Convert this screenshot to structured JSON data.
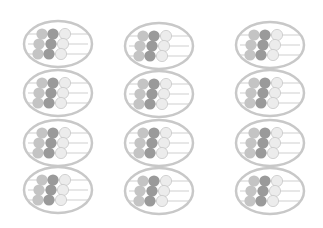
{
  "canvas": {
    "width": 323,
    "height": 228,
    "background": "#ffffff"
  },
  "colors": {
    "ring": "#c8c8c8",
    "rod": "#cfcfcf",
    "bead_light": "#c4c4c4",
    "bead_dark": "#9a9a9a",
    "bead_white": "#ececec",
    "bead_white_stroke": "#c8c8c8"
  },
  "grid": {
    "columns": 3,
    "rows": 4,
    "icon": "abacus-icon",
    "items": [
      {
        "x": 22,
        "y": 19
      },
      {
        "x": 123,
        "y": 21
      },
      {
        "x": 234,
        "y": 20
      },
      {
        "x": 22,
        "y": 68
      },
      {
        "x": 123,
        "y": 69
      },
      {
        "x": 234,
        "y": 68
      },
      {
        "x": 22,
        "y": 118
      },
      {
        "x": 123,
        "y": 118
      },
      {
        "x": 234,
        "y": 118
      },
      {
        "x": 22,
        "y": 165
      },
      {
        "x": 123,
        "y": 166
      },
      {
        "x": 234,
        "y": 166
      }
    ]
  }
}
